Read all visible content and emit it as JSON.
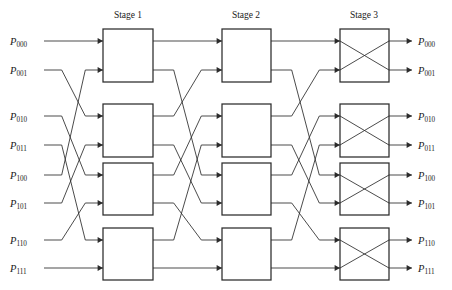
{
  "figure": {
    "type": "multistage-interconnection-network",
    "width": 452,
    "height": 290,
    "background": "#ffffff",
    "line_color": "#2b2b2b"
  },
  "stages": [
    {
      "label": "Stage 1",
      "x": 128,
      "box_left": 103,
      "box_right": 153,
      "switch_state": "through"
    },
    {
      "label": "Stage 2",
      "x": 246,
      "box_left": 222,
      "box_right": 271,
      "switch_state": "through"
    },
    {
      "label": "Stage 3",
      "x": 364,
      "box_left": 340,
      "box_right": 389,
      "switch_state": "cross"
    }
  ],
  "stage_label_y": 18,
  "rows": [
    {
      "index": 0,
      "y": 41
    },
    {
      "index": 1,
      "y": 70
    },
    {
      "index": 2,
      "y": 116
    },
    {
      "index": 3,
      "y": 145
    },
    {
      "index": 4,
      "y": 175
    },
    {
      "index": 5,
      "y": 203
    },
    {
      "index": 6,
      "y": 240
    },
    {
      "index": 7,
      "y": 268
    }
  ],
  "inputs": [
    {
      "base": "P",
      "sub": "000",
      "y": 41
    },
    {
      "base": "P",
      "sub": "001",
      "y": 70
    },
    {
      "base": "P",
      "sub": "010",
      "y": 116
    },
    {
      "base": "P",
      "sub": "011",
      "y": 145
    },
    {
      "base": "P",
      "sub": "100",
      "y": 175
    },
    {
      "base": "P",
      "sub": "101",
      "y": 203
    },
    {
      "base": "P",
      "sub": "110",
      "y": 240
    },
    {
      "base": "P",
      "sub": "111",
      "y": 268
    }
  ],
  "outputs": [
    {
      "base": "P",
      "sub": "000",
      "y": 41
    },
    {
      "base": "P",
      "sub": "001",
      "y": 70
    },
    {
      "base": "P",
      "sub": "010",
      "y": 116
    },
    {
      "base": "P",
      "sub": "011",
      "y": 145
    },
    {
      "base": "P",
      "sub": "100",
      "y": 175
    },
    {
      "base": "P",
      "sub": "101",
      "y": 203
    },
    {
      "base": "P",
      "sub": "110",
      "y": 240
    },
    {
      "base": "P",
      "sub": "111",
      "y": 268
    }
  ],
  "switch_boxes": [
    {
      "stage": 1,
      "index": 0,
      "top_row": 0,
      "bot_row": 1,
      "cross": false
    },
    {
      "stage": 1,
      "index": 1,
      "top_row": 2,
      "bot_row": 3,
      "cross": false
    },
    {
      "stage": 1,
      "index": 2,
      "top_row": 4,
      "bot_row": 5,
      "cross": false
    },
    {
      "stage": 1,
      "index": 3,
      "top_row": 6,
      "bot_row": 7,
      "cross": false
    },
    {
      "stage": 2,
      "index": 0,
      "top_row": 0,
      "bot_row": 1,
      "cross": false
    },
    {
      "stage": 2,
      "index": 1,
      "top_row": 2,
      "bot_row": 3,
      "cross": false
    },
    {
      "stage": 2,
      "index": 2,
      "top_row": 4,
      "bot_row": 5,
      "cross": false
    },
    {
      "stage": 2,
      "index": 3,
      "top_row": 6,
      "bot_row": 7,
      "cross": false
    },
    {
      "stage": 3,
      "index": 0,
      "top_row": 0,
      "bot_row": 1,
      "cross": true
    },
    {
      "stage": 3,
      "index": 1,
      "top_row": 2,
      "bot_row": 3,
      "cross": true
    },
    {
      "stage": 3,
      "index": 2,
      "top_row": 4,
      "bot_row": 5,
      "cross": true
    },
    {
      "stage": 3,
      "index": 3,
      "top_row": 6,
      "bot_row": 7,
      "cross": true
    }
  ],
  "permutations": {
    "input_to_stage1": [
      0,
      4,
      1,
      5,
      2,
      6,
      3,
      7
    ],
    "stage1_to_stage2": [
      0,
      2,
      4,
      6,
      1,
      3,
      5,
      7
    ],
    "stage2_to_stage3": [
      0,
      2,
      4,
      6,
      1,
      3,
      5,
      7
    ]
  },
  "geometry": {
    "label_x_left": 10,
    "wire_start_x": 44,
    "wire_end_x": 412,
    "label_x_right": 418,
    "bend_left_x": 62,
    "bend_right_x": 96,
    "box_half_height": 22
  }
}
